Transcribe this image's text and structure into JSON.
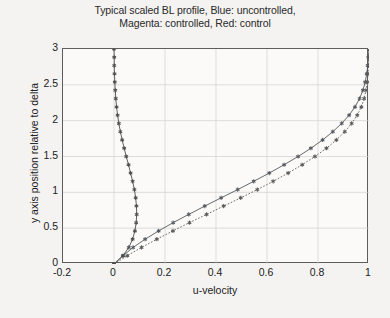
{
  "figure": {
    "title_lines": [
      "Typical scaled BL profile, Blue: uncontrolled,",
      "Magenta: controlled, Red: control"
    ],
    "background_color": "#f4f3f1",
    "axes_color": "#5d5d5d",
    "grid_color": "#d0d0d0"
  },
  "chart_data": {
    "type": "line",
    "title": "Typical scaled BL profile, Blue: uncontrolled, Magenta: controlled, Red: control",
    "xlabel": "u-velocity",
    "ylabel": "y axis position relative to delta",
    "xlim": [
      -0.2,
      1.0
    ],
    "ylim": [
      0,
      3
    ],
    "xticks": [
      -0.2,
      0,
      0.2,
      0.4,
      0.6,
      0.8,
      1
    ],
    "xtick_labels": [
      "-0.2",
      "0",
      "0.2",
      "0.4",
      "0.6",
      "0.8",
      "1"
    ],
    "yticks": [
      0,
      0.5,
      1,
      1.5,
      2,
      2.5,
      3
    ],
    "ytick_labels": [
      "0",
      "0.5",
      "1",
      "1.5",
      "2",
      "2.5",
      "3"
    ],
    "grid": true,
    "legend": "none",
    "legend_position": "in-title",
    "marker": "asterisk",
    "orientation": "y-is-independent",
    "series": [
      {
        "name": "uncontrolled",
        "color_name": "Blue",
        "color": "#555a60",
        "linestyle": "solid",
        "marker": "asterisk",
        "x": [
          0.0,
          0.035,
          0.075,
          0.122,
          0.175,
          0.232,
          0.293,
          0.356,
          0.42,
          0.485,
          0.548,
          0.609,
          0.667,
          0.722,
          0.772,
          0.818,
          0.858,
          0.893,
          0.922,
          0.945,
          0.963,
          0.976,
          0.985,
          0.991,
          0.995,
          0.998,
          1.0
        ],
        "y": [
          0.0,
          0.115,
          0.231,
          0.346,
          0.462,
          0.577,
          0.692,
          0.808,
          0.923,
          1.038,
          1.154,
          1.269,
          1.385,
          1.5,
          1.615,
          1.731,
          1.846,
          1.962,
          2.077,
          2.192,
          2.308,
          2.423,
          2.538,
          2.654,
          2.769,
          2.885,
          3.0
        ]
      },
      {
        "name": "controlled",
        "color_name": "Magenta",
        "color": "#5a5a5a",
        "linestyle": "dotted",
        "marker": "asterisk",
        "x": [
          0.0,
          0.052,
          0.108,
          0.168,
          0.231,
          0.296,
          0.363,
          0.43,
          0.497,
          0.562,
          0.624,
          0.683,
          0.738,
          0.788,
          0.833,
          0.872,
          0.905,
          0.932,
          0.954,
          0.97,
          0.981,
          0.988,
          0.993,
          0.996,
          0.998,
          0.999,
          1.0
        ],
        "y": [
          0.0,
          0.115,
          0.231,
          0.346,
          0.462,
          0.577,
          0.692,
          0.808,
          0.923,
          1.038,
          1.154,
          1.269,
          1.385,
          1.5,
          1.615,
          1.731,
          1.846,
          1.962,
          2.077,
          2.192,
          2.308,
          2.423,
          2.538,
          2.654,
          2.769,
          2.885,
          3.0
        ]
      },
      {
        "name": "control",
        "color_name": "Red",
        "color": "#4f4f4f",
        "linestyle": "solid",
        "marker": "asterisk",
        "x": [
          0.0,
          0.035,
          0.058,
          0.073,
          0.082,
          0.087,
          0.089,
          0.088,
          0.085,
          0.08,
          0.073,
          0.065,
          0.057,
          0.048,
          0.04,
          0.032,
          0.025,
          0.019,
          0.014,
          0.01,
          0.007,
          0.005,
          0.003,
          0.002,
          0.001,
          0.001,
          0.0
        ],
        "y": [
          0.0,
          0.115,
          0.231,
          0.346,
          0.462,
          0.577,
          0.692,
          0.808,
          0.923,
          1.038,
          1.154,
          1.269,
          1.385,
          1.5,
          1.615,
          1.731,
          1.846,
          1.962,
          2.077,
          2.192,
          2.308,
          2.423,
          2.538,
          2.654,
          2.769,
          2.885,
          3.0
        ]
      }
    ]
  }
}
